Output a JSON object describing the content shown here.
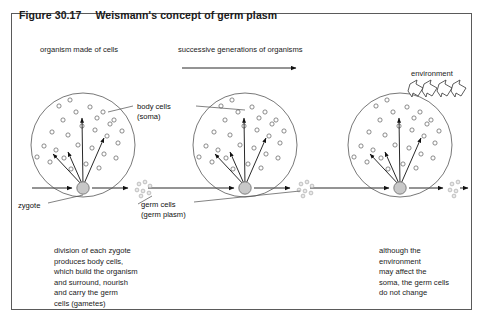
{
  "figure": {
    "number": "Figure 30.17",
    "title": "Weismann's concept of germ plasm"
  },
  "headings": {
    "organism": "organism made of cells",
    "generations": "successive generations of organisms"
  },
  "labels": {
    "body_cells_line1": "body cells",
    "body_cells_line2": "(soma)",
    "germ_cells_line1": "germ cells",
    "germ_cells_line2": "(germ plasm)",
    "zygote": "zygote",
    "environment": "environment"
  },
  "captions": {
    "left": "division of each zygote\nproduces body cells,\nwhich build the organism\nand surround, nourish\nand carry the germ\ncells (gametes)",
    "right": "although the\nenvironment\nmay affect the\nsoma, the germ cells\ndo not change"
  },
  "colors": {
    "frame": "#5a5a5a",
    "cell_outline": "#555555",
    "body_cell": "#666666",
    "germ_dot_fill": "#e8e8e8",
    "zygote_fill": "#c8c8c8",
    "arrow": "#111111",
    "text": "#1a1a1a",
    "background": "#ffffff"
  },
  "diagram": {
    "generations": [
      {
        "name": "generation-1",
        "cx": 83,
        "cy": 145,
        "r": 52
      },
      {
        "name": "generation-2",
        "cx": 245,
        "cy": 145,
        "r": 52
      },
      {
        "name": "generation-3",
        "cx": 400,
        "cy": 145,
        "r": 52
      }
    ],
    "germ_line_y": 188,
    "generations_arrow": {
      "x1": 182,
      "y1": 68,
      "x2": 298,
      "y2": 68
    },
    "environment_arrow_count": 4
  }
}
